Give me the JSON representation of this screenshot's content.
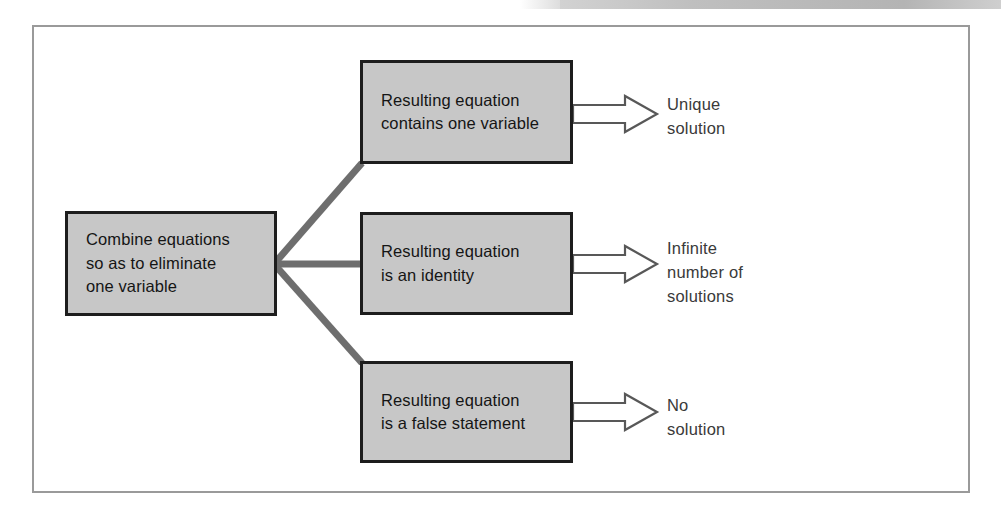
{
  "figure": {
    "type": "flowchart",
    "orientation": "left-to-right",
    "frame": {
      "border_color": "#9a9a9a",
      "background": "#ffffff"
    },
    "box_fill_color": "#c7c7c7",
    "box_border_color": "#1d1d1d",
    "connector_color": "#6e6e6e",
    "arrow_outline_color": "#5a5a5a"
  },
  "nodes": {
    "start": {
      "id": "combine-equations",
      "text": "Combine equations\nso as to eliminate\none variable"
    },
    "branches": [
      {
        "id": "one-variable",
        "text": "Resulting equation\ncontains one variable",
        "outcome_id": "unique-solution",
        "outcome_text": "Unique\nsolution"
      },
      {
        "id": "identity",
        "text": "Resulting equation\nis an identity",
        "outcome_id": "infinite-solutions",
        "outcome_text": "Infinite\nnumber of\nsolutions"
      },
      {
        "id": "false-statement",
        "text": "Resulting equation\nis a false statement",
        "outcome_id": "no-solution",
        "outcome_text": "No\nsolution"
      }
    ]
  }
}
